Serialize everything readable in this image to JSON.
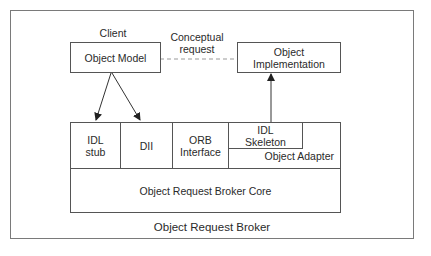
{
  "diagram": {
    "title": "Object Request Broker",
    "client_label": "Client",
    "conceptual_request_label": [
      "Conceptual",
      "request"
    ],
    "nodes": {
      "object_model": "Object Model",
      "object_implementation": [
        "Object",
        "Implementation"
      ],
      "idl_stub": [
        "IDL",
        "stub"
      ],
      "dii": "DII",
      "orb_interface": [
        "ORB",
        "Interface"
      ],
      "idl_skeleton": [
        "IDL",
        "Skeleton"
      ],
      "object_adapter": "Object Adapter",
      "orb_core": "Object Request Broker Core"
    },
    "edges": [
      {
        "from": "object_model",
        "to": "idl_stub",
        "style": "solid-arrow"
      },
      {
        "from": "object_model",
        "to": "dii",
        "style": "solid-arrow"
      },
      {
        "from": "object_model",
        "to": "object_implementation",
        "style": "dashed",
        "label": "Conceptual request"
      },
      {
        "from": "idl_skeleton",
        "to": "object_implementation",
        "style": "solid-arrow"
      }
    ]
  }
}
